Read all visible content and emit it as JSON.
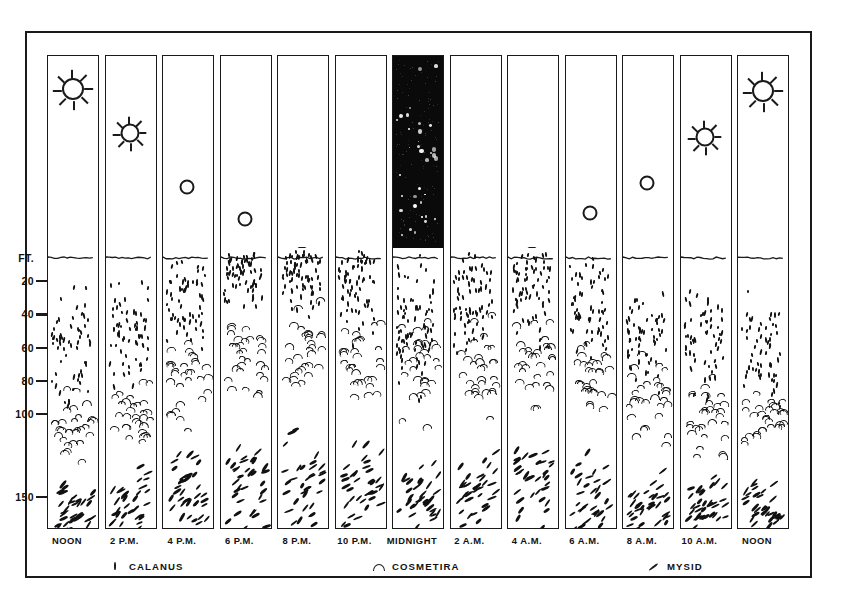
{
  "figure": {
    "depth_axis": {
      "unit_label": "FT.",
      "ticks": [
        "20",
        "40",
        "60",
        "80",
        "100",
        "150"
      ]
    },
    "times": [
      "NOON",
      "2 P.M.",
      "4 P.M.",
      "6 P.M.",
      "8 P.M.",
      "10 P.M.",
      "MIDNIGHT",
      "2 A.M.",
      "4 A.M.",
      "6 A.M.",
      "8 A.M.",
      "10 A.M.",
      "NOON"
    ],
    "legend": [
      {
        "symbol": "calanus-symbol",
        "label": "CALANUS"
      },
      {
        "symbol": "cosmetira-symbol",
        "label": "COSMETIRA"
      },
      {
        "symbol": "mysid-symbol",
        "label": "MYSID"
      }
    ],
    "colors": {
      "ink": "#1a1a1a",
      "night_sky": "#0a0a0a",
      "star": "#ffffff",
      "paper": "#ffffff"
    }
  },
  "chart_data": {
    "type": "heatmap",
    "xlabel": "",
    "ylabel": "FT.",
    "grid": false,
    "legend_position": "bottom",
    "ylim": [
      0,
      170
    ],
    "categories": [
      "NOON",
      "2 P.M.",
      "4 P.M.",
      "6 P.M.",
      "8 P.M.",
      "10 P.M.",
      "MIDNIGHT",
      "2 A.M.",
      "4 A.M.",
      "6 A.M.",
      "8 A.M.",
      "10 A.M.",
      "NOON"
    ],
    "depth_ticks": [
      20,
      40,
      60,
      80,
      100,
      150
    ],
    "sky": [
      {
        "time": "NOON",
        "state": "day",
        "sun": "high-sun-rays",
        "sun_height_pct": 17
      },
      {
        "time": "2 P.M.",
        "state": "day",
        "sun": "sun-rays",
        "sun_height_pct": 40
      },
      {
        "time": "4 P.M.",
        "state": "day",
        "sun": "sun-disc",
        "sun_height_pct": 68
      },
      {
        "time": "6 P.M.",
        "state": "day",
        "sun": "sun-disc",
        "sun_height_pct": 85
      },
      {
        "time": "8 P.M.",
        "state": "dusk",
        "sun": "sun-horizon",
        "sun_height_pct": 99
      },
      {
        "time": "10 P.M.",
        "state": "dusk",
        "sun": "none",
        "sun_height_pct": null
      },
      {
        "time": "MIDNIGHT",
        "state": "night",
        "sun": "stars",
        "sun_height_pct": null
      },
      {
        "time": "2 A.M.",
        "state": "dawn",
        "sun": "none",
        "sun_height_pct": null
      },
      {
        "time": "4 A.M.",
        "state": "dawn",
        "sun": "sun-horizon",
        "sun_height_pct": 99
      },
      {
        "time": "6 A.M.",
        "state": "day",
        "sun": "sun-disc",
        "sun_height_pct": 82
      },
      {
        "time": "8 A.M.",
        "state": "day",
        "sun": "sun-disc",
        "sun_height_pct": 66
      },
      {
        "time": "10 A.M.",
        "state": "day",
        "sun": "sun-rays",
        "sun_height_pct": 42
      },
      {
        "time": "NOON",
        "state": "day",
        "sun": "high-sun-rays",
        "sun_height_pct": 18
      }
    ],
    "series": [
      {
        "name": "CALANUS",
        "symbol": "short vertical dash",
        "band_top_ft": [
          15,
          12,
          6,
          2,
          1,
          1,
          1,
          1,
          1,
          3,
          8,
          12,
          15
        ],
        "band_bottom_ft": [
          95,
          90,
          80,
          75,
          80,
          85,
          95,
          90,
          85,
          85,
          90,
          92,
          95
        ],
        "peak_depth_ft": [
          60,
          52,
          30,
          14,
          12,
          18,
          45,
          30,
          22,
          34,
          48,
          55,
          60
        ],
        "counts": [
          58,
          62,
          60,
          64,
          68,
          66,
          78,
          70,
          66,
          62,
          60,
          58,
          58
        ]
      },
      {
        "name": "COSMETIRA",
        "symbol": "arc / caret",
        "band_top_ft": [
          82,
          70,
          48,
          30,
          28,
          34,
          36,
          34,
          34,
          44,
          56,
          68,
          80
        ],
        "band_bottom_ft": [
          128,
          122,
          112,
          100,
          102,
          108,
          112,
          110,
          106,
          110,
          118,
          124,
          128
        ],
        "peak_depth_ft": [
          104,
          96,
          78,
          62,
          60,
          68,
          72,
          70,
          66,
          76,
          88,
          98,
          104
        ],
        "counts": [
          30,
          30,
          30,
          30,
          30,
          30,
          30,
          30,
          30,
          30,
          30,
          30,
          30
        ]
      },
      {
        "name": "MYSID",
        "symbol": "slanted elongated dash",
        "band_top_ft": [
          125,
          122,
          112,
          104,
          100,
          106,
          108,
          106,
          104,
          112,
          118,
          122,
          125
        ],
        "band_bottom_ft": [
          170,
          170,
          170,
          170,
          170,
          170,
          170,
          170,
          170,
          170,
          170,
          170,
          170
        ],
        "peak_depth_ft": [
          158,
          155,
          148,
          140,
          138,
          144,
          148,
          146,
          142,
          150,
          154,
          156,
          158
        ],
        "counts": [
          34,
          34,
          34,
          34,
          34,
          34,
          34,
          34,
          34,
          34,
          34,
          34,
          34
        ]
      }
    ],
    "annotation": "Plankton rise toward the surface at night and descend by day; Calanus occupies the shallowest band, Cosmetira intermediate, Mysid the deepest."
  }
}
